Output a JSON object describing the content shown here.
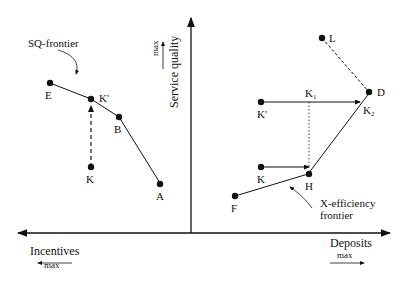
{
  "axes": {
    "y_label": "Service quality",
    "y_max": "max",
    "x_left_label": "Incentives",
    "x_left_max": "max",
    "x_right_label": "Deposits",
    "x_right_max": "max"
  },
  "left_panel": {
    "frontier_label": "SQ-frontier",
    "points": {
      "E": "E",
      "Kp": "K'",
      "B": "B",
      "K": "K",
      "A": "A"
    }
  },
  "right_panel": {
    "frontier_label_1": "X-efficiency",
    "frontier_label_2": "frontier",
    "points": {
      "L": "L",
      "D": "D",
      "K1": "K",
      "K1_sub": "1",
      "K2": "K",
      "K2_sub": "2",
      "Kp": "K'",
      "K": "K",
      "H": "H",
      "F": "F"
    }
  }
}
